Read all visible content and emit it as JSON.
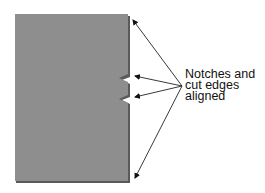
{
  "diagram": {
    "title": "",
    "fabric_color": "#8e8e8e",
    "edge_color": "#555555",
    "label_lines": [
      "Notches and",
      "cut edges",
      "aligned"
    ],
    "callout_targets": [
      "top-edge-corner",
      "upper-notch",
      "lower-notch",
      "bottom-edge-corner"
    ]
  }
}
